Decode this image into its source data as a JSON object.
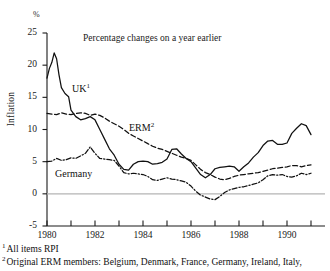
{
  "chart_data": {
    "type": "line",
    "title": "Percentage changes on a year earlier",
    "xlabel": "",
    "ylabel": "Inflation",
    "yunit": "%",
    "ylim": [
      -5,
      25
    ],
    "xlim": [
      1980,
      1991
    ],
    "yticks": [
      "25",
      "20",
      "15",
      "10",
      "5",
      "0",
      "-5"
    ],
    "ytick_values": [
      25,
      20,
      15,
      10,
      5,
      0,
      -5
    ],
    "xticks": [
      "1980",
      "1982",
      "1984",
      "1986",
      "1988",
      "1990"
    ],
    "xtick_values": [
      1980,
      1982,
      1984,
      1986,
      1988,
      1990
    ],
    "xtick_minor_values": [
      1981,
      1983,
      1985,
      1987,
      1989,
      1991
    ],
    "grid": false,
    "zero_line": true,
    "legend": "inline-labels",
    "series": [
      {
        "name": "UK",
        "label": "UK",
        "label_superscript": "1",
        "style": "solid",
        "color": "#111111",
        "x": [
          1980.0,
          1980.1,
          1980.2,
          1980.3,
          1980.4,
          1980.5,
          1980.6,
          1980.75,
          1980.9,
          1981.0,
          1981.2,
          1981.4,
          1981.6,
          1981.8,
          1982.0,
          1982.2,
          1982.4,
          1982.6,
          1982.8,
          1983.0,
          1983.2,
          1983.4,
          1983.6,
          1983.8,
          1984.0,
          1984.2,
          1984.4,
          1984.6,
          1984.8,
          1985.0,
          1985.2,
          1985.4,
          1985.6,
          1985.8,
          1986.0,
          1986.2,
          1986.4,
          1986.6,
          1986.8,
          1987.0,
          1987.2,
          1987.4,
          1987.6,
          1987.8,
          1988.0,
          1988.2,
          1988.4,
          1988.6,
          1988.8,
          1989.0,
          1989.2,
          1989.4,
          1989.6,
          1989.8,
          1990.0,
          1990.2,
          1990.4,
          1990.6,
          1990.8,
          1991.0
        ],
        "values": [
          18.0,
          19.5,
          20.4,
          21.9,
          21.0,
          18.5,
          16.5,
          15.6,
          15.1,
          13.0,
          12.0,
          11.5,
          11.7,
          12.0,
          11.5,
          10.0,
          8.5,
          7.0,
          6.0,
          4.6,
          3.8,
          3.7,
          4.6,
          5.0,
          5.1,
          5.0,
          4.6,
          4.7,
          4.9,
          5.4,
          6.9,
          7.0,
          6.2,
          5.5,
          5.0,
          4.0,
          3.0,
          2.5,
          3.0,
          3.9,
          4.1,
          4.2,
          4.3,
          4.2,
          3.5,
          4.2,
          4.8,
          5.7,
          6.4,
          7.5,
          8.2,
          8.3,
          7.7,
          7.7,
          7.9,
          9.4,
          10.2,
          10.9,
          10.6,
          9.2
        ]
      },
      {
        "name": "ERM",
        "label": "ERM",
        "label_superscript": "2",
        "style": "dashed",
        "color": "#111111",
        "x": [
          1980.0,
          1980.2,
          1980.4,
          1980.6,
          1980.8,
          1981.0,
          1981.2,
          1981.4,
          1981.6,
          1981.8,
          1982.0,
          1982.2,
          1982.4,
          1982.6,
          1982.8,
          1983.0,
          1983.2,
          1983.4,
          1983.6,
          1983.8,
          1984.0,
          1984.2,
          1984.4,
          1984.6,
          1984.8,
          1985.0,
          1985.2,
          1985.4,
          1985.6,
          1985.8,
          1986.0,
          1986.2,
          1986.4,
          1986.6,
          1986.8,
          1987.0,
          1987.2,
          1987.4,
          1987.6,
          1987.8,
          1988.0,
          1988.2,
          1988.4,
          1988.6,
          1988.8,
          1989.0,
          1989.2,
          1989.4,
          1989.6,
          1989.8,
          1990.0,
          1990.2,
          1990.4,
          1990.6,
          1990.8,
          1991.0
        ],
        "values": [
          12.5,
          12.4,
          12.3,
          12.6,
          12.4,
          12.3,
          12.5,
          12.6,
          12.5,
          12.2,
          12.4,
          12.2,
          11.8,
          11.3,
          10.9,
          10.5,
          10.0,
          9.4,
          9.0,
          8.6,
          8.2,
          7.8,
          7.4,
          7.1,
          6.9,
          6.6,
          6.3,
          6.0,
          5.7,
          5.5,
          5.2,
          4.5,
          3.8,
          3.3,
          3.0,
          2.6,
          2.3,
          2.2,
          2.4,
          2.7,
          2.9,
          3.0,
          3.1,
          3.2,
          3.3,
          3.5,
          3.7,
          3.9,
          4.0,
          4.1,
          4.2,
          4.4,
          4.4,
          4.2,
          4.4,
          4.5
        ]
      },
      {
        "name": "Germany",
        "label": "Germany",
        "label_superscript": "",
        "style": "dash-dot",
        "color": "#111111",
        "x": [
          1980.0,
          1980.2,
          1980.4,
          1980.6,
          1980.8,
          1981.0,
          1981.2,
          1981.4,
          1981.6,
          1981.8,
          1982.0,
          1982.2,
          1982.4,
          1982.6,
          1982.8,
          1983.0,
          1983.2,
          1983.4,
          1983.6,
          1983.8,
          1984.0,
          1984.2,
          1984.4,
          1984.6,
          1984.8,
          1985.0,
          1985.2,
          1985.4,
          1985.6,
          1985.8,
          1986.0,
          1986.2,
          1986.4,
          1986.6,
          1986.8,
          1987.0,
          1987.2,
          1987.4,
          1987.6,
          1987.8,
          1988.0,
          1988.2,
          1988.4,
          1988.6,
          1988.8,
          1989.0,
          1989.2,
          1989.4,
          1989.6,
          1989.8,
          1990.0,
          1990.2,
          1990.4,
          1990.6,
          1990.8,
          1991.0
        ],
        "values": [
          5.0,
          5.1,
          5.5,
          5.2,
          5.3,
          5.6,
          5.5,
          5.9,
          6.3,
          7.3,
          6.3,
          5.5,
          5.4,
          5.3,
          5.2,
          4.3,
          3.3,
          3.1,
          3.2,
          3.1,
          3.0,
          2.7,
          2.2,
          2.1,
          2.3,
          2.5,
          2.3,
          2.2,
          2.0,
          1.8,
          1.2,
          0.4,
          -0.2,
          -0.5,
          -0.8,
          -0.9,
          -0.4,
          0.2,
          0.6,
          0.8,
          1.0,
          1.1,
          1.3,
          1.5,
          1.7,
          2.2,
          2.8,
          3.0,
          2.9,
          3.0,
          2.7,
          2.6,
          2.8,
          3.2,
          3.0,
          3.2
        ]
      }
    ],
    "annotations": [
      {
        "text": "Percentage changes on a year earlier",
        "x": 1982.2,
        "y": 23.0
      }
    ]
  },
  "footnotes": [
    {
      "marker": "1",
      "text": "All items RPI"
    },
    {
      "marker": "2",
      "text": "Original ERM members:  Belgium, Denmark, France, Germany, Ireland, Italy,"
    }
  ],
  "colors": {
    "ink": "#111111",
    "axis": "#1a1a1a",
    "zero_line": "#b4b4b4",
    "background": "#ffffff"
  }
}
